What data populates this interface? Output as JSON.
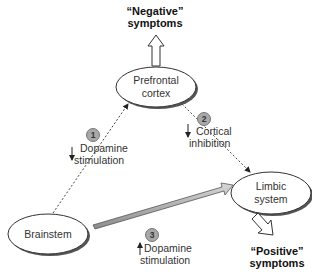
{
  "diagram": {
    "nodes": {
      "prefrontal": {
        "line1": "Prefrontal",
        "line2": "cortex"
      },
      "limbic": {
        "line1": "Limbic",
        "line2": "system"
      },
      "brainstem": {
        "label": "Brainstem"
      }
    },
    "outputs": {
      "negative": {
        "line1": "“Negative”",
        "line2": "symptoms"
      },
      "positive": {
        "line1": "“Positive”",
        "line2": "symptoms"
      }
    },
    "pathways": [
      {
        "number": "1",
        "direction": "down",
        "line1": "Dopamine",
        "line2": "stimulation"
      },
      {
        "number": "2",
        "direction": "down",
        "line1": "Cortical",
        "line2": "inhibition"
      },
      {
        "number": "3",
        "direction": "up",
        "line1": "Dopamine",
        "line2": "stimulation"
      }
    ],
    "colors": {
      "badge": "#a8a8a8",
      "arrow_fill": "#b0b0b0",
      "line": "#333333"
    }
  }
}
